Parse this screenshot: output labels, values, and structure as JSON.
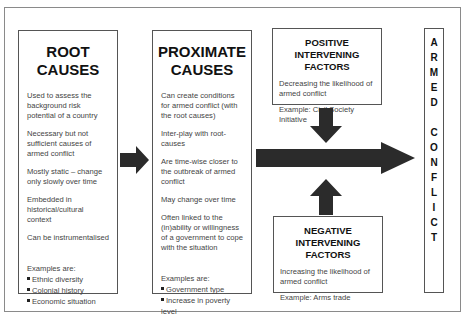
{
  "diagram": {
    "root": {
      "title_line1": "ROOT",
      "title_line2": "CAUSES",
      "points": [
        "Used to assess the background risk potential of a country",
        "Necessary but not sufficient causes of armed conflict",
        "Mostly static – change only slowly over time",
        "Embedded in historical/cultural context",
        "Can be instrumentalised"
      ],
      "examples_label": "Examples are:",
      "examples": [
        "Ethnic diversity",
        "Colonial history",
        "Economic situation"
      ]
    },
    "proximate": {
      "title_line1": "PROXIMATE",
      "title_line2": "CAUSES",
      "points": [
        "Can create conditions for armed conflict (with the root causes)",
        "Inter-play with root-causes",
        "Are time-wise closer to the outbreak of armed conflict",
        "May change over time",
        "Often linked to the (in)ability or willingness of a government to cope with the situation"
      ],
      "examples_label": "Examples are:",
      "examples": [
        "Government type",
        "Increase in poverty level"
      ]
    },
    "positive": {
      "title_line1": "POSITIVE INTERVENING",
      "title_line2": "FACTORS",
      "description": "Decreasing the likelihood of armed conflict",
      "example": "Example: Civil Society Initiative"
    },
    "negative": {
      "title_line1": "NEGATIVE INTERVENING",
      "title_line2": "FACTORS",
      "description": "Increasing the likelihood of armed conflict",
      "example": "Example: Arms trade"
    },
    "outcome": {
      "letters": [
        "A",
        "R",
        "M",
        "E",
        "D",
        " ",
        "C",
        "O",
        "N",
        "F",
        "L",
        "I",
        "C",
        "T"
      ]
    },
    "colors": {
      "arrow": "#2b2b2b",
      "border": "#555555",
      "frame": "#8a8a8a"
    }
  }
}
